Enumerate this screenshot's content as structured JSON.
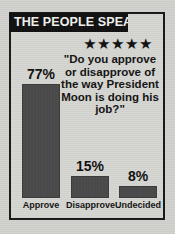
{
  "graphic": {
    "banner_title": "THE PEOPLE SPEAK",
    "stars": "★★★★★",
    "star_count": 5,
    "quote": "\"Do you approve or disapprove of the way President Moon is doing his job?\"",
    "colors": {
      "banner_background": "#121212",
      "banner_text": "#f2f2ef",
      "bar_fill": "#4b4b4b",
      "frame_border": "#1a1a1a",
      "paper_background": "#d2d2ce",
      "text": "#141414"
    }
  },
  "chart_data": {
    "type": "bar",
    "title": "THE PEOPLE SPEAK",
    "subtitle": "\"Do you approve or disapprove of the way President Moon is doing his job?\"",
    "categories": [
      "Approve",
      "Disapprove",
      "Undecided"
    ],
    "values": [
      77,
      15,
      8
    ],
    "value_labels": [
      "77%",
      "15%",
      "8%"
    ],
    "xlabel": "",
    "ylabel": "",
    "ylim": [
      0,
      100
    ],
    "grid": false,
    "legend": "none",
    "unit": "percent",
    "bars": [
      {
        "label": "Approve",
        "value": 77,
        "display": "77%"
      },
      {
        "label": "Disapprove",
        "value": 15,
        "display": "15%"
      },
      {
        "label": "Undecided",
        "value": 8,
        "display": "8%"
      }
    ]
  }
}
